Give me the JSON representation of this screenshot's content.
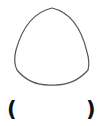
{
  "figure": {
    "shape": "reuleaux-triangle",
    "stroke_color": "#555555",
    "fill_color": "#ffffff"
  },
  "answer": {
    "open_paren": "(",
    "close_paren": ")",
    "value": ""
  }
}
